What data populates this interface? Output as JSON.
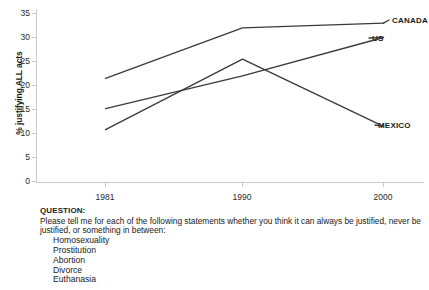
{
  "chart_data": {
    "type": "line",
    "title": "",
    "xlabel": "",
    "ylabel": "% justifying ALL acts",
    "categories": [
      "1981",
      "1990",
      "2000"
    ],
    "ylim": [
      0,
      35
    ],
    "yticks": [
      "0",
      "5",
      "10",
      "15",
      "20",
      "25",
      "30",
      "35"
    ],
    "grid": false,
    "legend_position": "right-end-of-line",
    "series": [
      {
        "name": "CANADA",
        "values": [
          21.5,
          32.0,
          33.0
        ],
        "color": "#3a3a3a"
      },
      {
        "name": "US",
        "values": [
          15.2,
          22.0,
          30.0
        ],
        "color": "#3a3a3a"
      },
      {
        "name": "MEXICO",
        "values": [
          10.8,
          25.5,
          11.5
        ],
        "color": "#3a3a3a"
      }
    ]
  },
  "axis": {
    "y_title": "% justifying ALL acts",
    "y_tick_labels": [
      "35",
      "30",
      "25",
      "20",
      "15",
      "10",
      "5",
      "0"
    ],
    "x_tick_labels": [
      "1981",
      "1990",
      "2000"
    ]
  },
  "series_labels": {
    "canada": "CANADA",
    "us": "US",
    "mexico": "MEXICO"
  },
  "question": {
    "heading": "QUESTION:",
    "text": "Please tell me for each of the following statements whether you think it can always be justified, never be justified, or something in between:",
    "items": [
      "Homosexuality",
      "Prostitution",
      "Abortion",
      "Divorce",
      "Euthanasia"
    ]
  },
  "colors": {
    "line": "#3a3a3a",
    "axis": "#c9c9c9",
    "text": "#1a1a1a"
  }
}
